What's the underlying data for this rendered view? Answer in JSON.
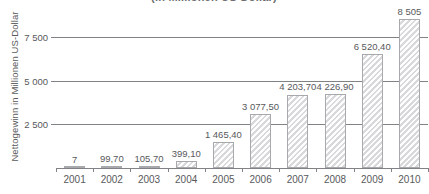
{
  "chart_data": {
    "type": "bar",
    "title": "(in Millionen US-Dollar)",
    "xlabel": "",
    "ylabel": "Nettogewinn in Millionen US-Dollar",
    "categories": [
      "2001",
      "2002",
      "2003",
      "2004",
      "2005",
      "2006",
      "2007",
      "2008",
      "2009",
      "2010"
    ],
    "values": [
      7,
      99.7,
      105.7,
      399.1,
      1465.4,
      3077.5,
      4203.7,
      4226.9,
      6520.4,
      8505
    ],
    "value_labels": [
      "7",
      "99,70",
      "105,70",
      "399,10",
      "1 465,40",
      "3 077,50",
      "4 203,70",
      "4 226,90",
      "6 520,40",
      "8 505"
    ],
    "ylim": [
      0,
      9150
    ],
    "ytick_values": [
      2500,
      5000,
      7500
    ],
    "ytick_labels": [
      "2 500",
      "5 000",
      "7 500"
    ],
    "grid": true,
    "legend": false,
    "colors": {
      "bar_fill": "#e9e9ea",
      "bar_border": "#a7a9ac",
      "axis": "#808285",
      "text": "#58595b"
    }
  }
}
